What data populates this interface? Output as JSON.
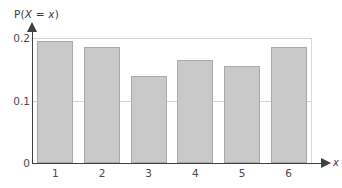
{
  "chart_data": {
    "type": "bar",
    "title": "",
    "subtitle": "",
    "xlabel": "x",
    "ylabel": "P(X = x)",
    "ylabel_parts": {
      "prefix": "P(",
      "var_upper": "X",
      "middle": " = ",
      "var_lower": "x",
      "suffix": ")"
    },
    "categories": [
      "1",
      "2",
      "3",
      "4",
      "5",
      "6"
    ],
    "values": [
      0.195,
      0.185,
      0.14,
      0.165,
      0.155,
      0.185
    ],
    "xlim": [
      0.5,
      6.5
    ],
    "ylim": [
      0,
      0.2
    ],
    "y_ticks": [
      "0",
      "0.1",
      "0.2"
    ],
    "y_tick_values": [
      0,
      0.1,
      0.2
    ],
    "x_ticks": [
      "1",
      "2",
      "3",
      "4",
      "5",
      "6"
    ],
    "grid": true,
    "grid_axis": "y",
    "legend": null,
    "legend_position": "none",
    "annotations": [],
    "colors": {
      "bar_fill": "#c9c9c9",
      "bar_border": "#a9a9a9",
      "axis": "#3f3f3f",
      "gridline": "#d2d2d2",
      "frame": "#d9d9d9",
      "text": "#4a4a4a",
      "background": "#ffffff"
    }
  }
}
